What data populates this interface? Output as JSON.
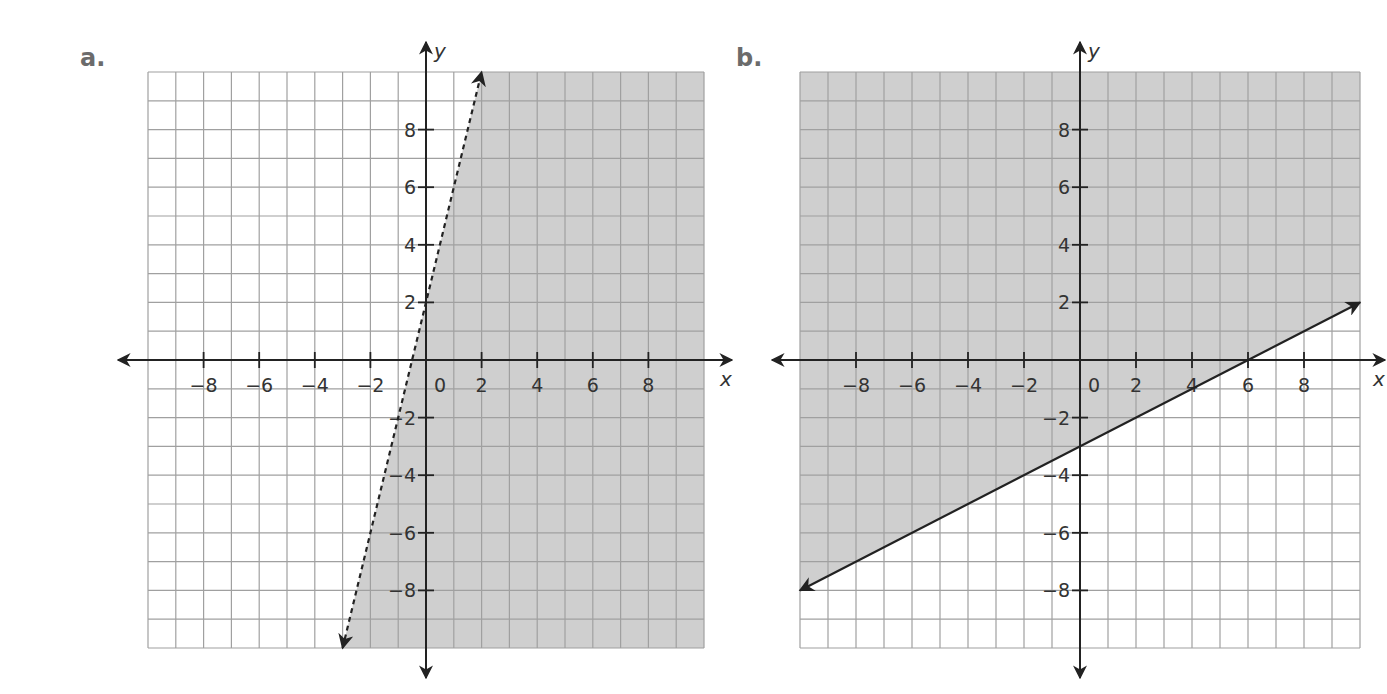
{
  "panels": [
    {
      "label": "a.",
      "x_axis_name": "x",
      "y_axis_name": "y"
    },
    {
      "label": "b.",
      "x_axis_name": "x",
      "y_axis_name": "y"
    }
  ],
  "chart_data": [
    {
      "type": "line",
      "panel": "a.",
      "title": "",
      "xlabel": "x",
      "ylabel": "y",
      "xlim": [
        -10,
        10
      ],
      "ylim": [
        -10,
        10
      ],
      "grid": true,
      "x_ticks": [
        -8,
        -6,
        -4,
        -2,
        0,
        2,
        4,
        6,
        8
      ],
      "y_ticks": [
        8,
        6,
        4,
        2,
        -2,
        -4,
        -6,
        -8
      ],
      "boundary_line": {
        "equation": "y = 4x + 2",
        "style": "dashed",
        "endpoints": [
          [
            -3,
            -10
          ],
          [
            2,
            10
          ]
        ],
        "points": [
          [
            -0.5,
            0
          ],
          [
            0,
            2
          ]
        ]
      },
      "shaded_region": "right of / below line (y < 4x + 2)",
      "colors": {
        "shade": "#cfcfcf",
        "grid": "#a0a0a0",
        "axis": "#222222",
        "background": "#ffffff"
      }
    },
    {
      "type": "line",
      "panel": "b.",
      "title": "",
      "xlabel": "x",
      "ylabel": "y",
      "xlim": [
        -10,
        10
      ],
      "ylim": [
        -10,
        10
      ],
      "grid": true,
      "x_ticks": [
        -8,
        -6,
        -4,
        -2,
        0,
        2,
        4,
        6,
        8
      ],
      "y_ticks": [
        8,
        6,
        4,
        2,
        -2,
        -4,
        -6,
        -8
      ],
      "boundary_line": {
        "equation": "y = 0.5x - 3",
        "style": "solid",
        "endpoints": [
          [
            -10,
            -8
          ],
          [
            10,
            2
          ]
        ],
        "points": [
          [
            0,
            -3
          ],
          [
            6,
            0
          ]
        ]
      },
      "shaded_region": "above line (y >= 0.5x - 3)",
      "colors": {
        "shade": "#cfcfcf",
        "grid": "#a0a0a0",
        "axis": "#222222",
        "background": "#ffffff"
      }
    }
  ]
}
